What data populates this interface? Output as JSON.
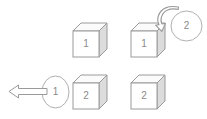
{
  "canvas": {
    "width": 207,
    "height": 119,
    "background": "#ffffff"
  },
  "style": {
    "outline_color": "#9a9a9a",
    "cube_front_fill": "#ffffff",
    "cube_top_fill": "#fbfbfb",
    "cube_side_fill": "#dcdcdc",
    "label_color": "#8a8a8a",
    "circle_fill": "#ffffff",
    "arrow_fill": "#ffffff"
  },
  "diagram": {
    "title": "",
    "objects": [
      {
        "id": "cube-top-left",
        "kind": "cube",
        "label": "1",
        "x": 73,
        "y": 23,
        "size": 26
      },
      {
        "id": "cube-top-right",
        "kind": "cube",
        "label": "1",
        "x": 131,
        "y": 23,
        "size": 26
      },
      {
        "id": "cube-bottom-left",
        "kind": "cube",
        "label": "2",
        "x": 73,
        "y": 75,
        "size": 26
      },
      {
        "id": "cube-bottom-right",
        "kind": "cube",
        "label": "2",
        "x": 131,
        "y": 75,
        "size": 26
      },
      {
        "id": "circle-top-right",
        "kind": "circle",
        "label": "2",
        "x": 170,
        "y": 10,
        "width": 32,
        "height": 31
      },
      {
        "id": "circle-bottom-left",
        "kind": "circle",
        "label": "1",
        "x": 41,
        "y": 75,
        "width": 28,
        "height": 33
      },
      {
        "id": "arrow-curved-top-right",
        "kind": "arrow-curved",
        "direction": "down-left",
        "from": "circle-top-right",
        "to": "cube-top-right"
      },
      {
        "id": "arrow-straight-bottom-left",
        "kind": "arrow-straight",
        "direction": "left",
        "from": "circle-bottom-left",
        "to": "canvas-left-edge"
      }
    ]
  }
}
